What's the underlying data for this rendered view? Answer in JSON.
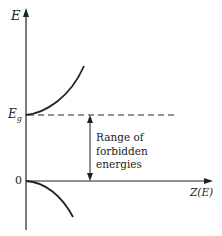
{
  "diagram": {
    "y_axis_label": "E",
    "x_axis_label": "Z(E)",
    "gap_level_label_main": "E",
    "gap_level_label_sub": "g",
    "zero_label": "0",
    "range_annotation": [
      "Range of",
      "forbidden",
      "energies"
    ],
    "colors": {
      "ink": "#222222",
      "background": "#ffffff"
    }
  }
}
